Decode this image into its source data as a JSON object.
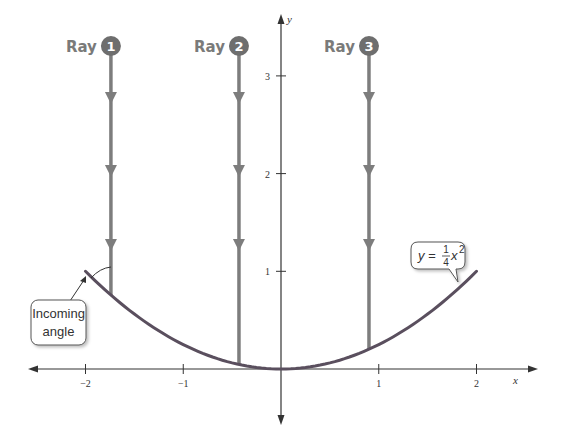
{
  "colors": {
    "axis": "#333333",
    "ray": "#7d7d7d",
    "ray_badge": "#6e6e6e",
    "parabola": "#5a4f5e",
    "callout_border": "#555555",
    "text": "#333333"
  },
  "axes": {
    "x_label": "x",
    "y_label": "y",
    "x_ticks": [
      {
        "value": -2,
        "label": "−2"
      },
      {
        "value": -1,
        "label": "−1"
      },
      {
        "value": 1,
        "label": "1"
      },
      {
        "value": 2,
        "label": "2"
      }
    ],
    "y_ticks": [
      {
        "value": 1,
        "label": "1"
      },
      {
        "value": 2,
        "label": "2"
      },
      {
        "value": 3,
        "label": "3"
      }
    ]
  },
  "rays": [
    {
      "label": "Ray",
      "number": "1",
      "x": -1.74
    },
    {
      "label": "Ray",
      "number": "2",
      "x": -0.43
    },
    {
      "label": "Ray",
      "number": "3",
      "x": 0.9
    }
  ],
  "curve": {
    "equation_lhs": "y =",
    "frac_num": "1",
    "frac_den": "4",
    "var": "x",
    "exponent": "2",
    "domain": [
      -2,
      2
    ]
  },
  "callout": {
    "line1": "Incoming",
    "line2": "angle"
  }
}
